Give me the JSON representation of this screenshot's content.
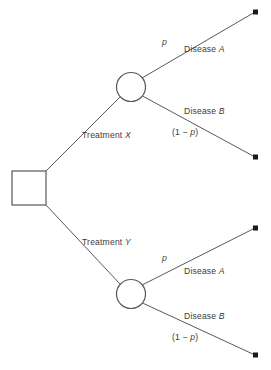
{
  "diagram": {
    "type": "decision-tree",
    "colors": {
      "background": "#ffffff",
      "line": "#58595b",
      "node_stroke": "#58595b",
      "node_fill": "#ffffff",
      "terminal_dot": "#1a1a1a",
      "text": "#3b3b3d"
    },
    "nodes": {
      "decision": {
        "shape": "square",
        "name": "decision-node",
        "x": 12,
        "y": 171,
        "size": 34
      },
      "chance_upper": {
        "shape": "circle",
        "name": "chance-node-upper",
        "cx": 131,
        "cy": 87,
        "r": 14.5
      },
      "chance_lower": {
        "shape": "circle",
        "name": "chance-node-lower",
        "cx": 131,
        "cy": 294,
        "r": 14.5
      }
    },
    "branches": {
      "treatment_x": {
        "label": "Treatment ",
        "variable": "X"
      },
      "treatment_y": {
        "label": "Treatment ",
        "variable": "Y"
      },
      "disease_a_upper": {
        "label": "Disease ",
        "variable": "A"
      },
      "disease_b_upper": {
        "label": "Disease ",
        "variable": "B"
      },
      "disease_a_lower": {
        "label": "Disease ",
        "variable": "A"
      },
      "disease_b_lower": {
        "label": "Disease ",
        "variable": "B"
      }
    },
    "probabilities": {
      "p_upper_a": "p",
      "p_upper_b_prefix": "(1 − ",
      "p_upper_b_var": "p",
      "p_upper_b_suffix": ")",
      "p_lower_a": "p",
      "p_lower_b_prefix": "(1 − ",
      "p_lower_b_var": "p",
      "p_lower_b_suffix": ")"
    },
    "terminals": [
      {
        "name": "terminal-node-1",
        "x": 256,
        "y": 12
      },
      {
        "name": "terminal-node-2",
        "x": 256,
        "y": 157
      },
      {
        "name": "terminal-node-3",
        "x": 256,
        "y": 228
      },
      {
        "name": "terminal-node-4",
        "x": 256,
        "y": 355
      }
    ]
  }
}
